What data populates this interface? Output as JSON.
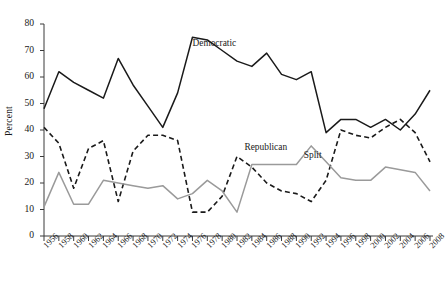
{
  "chart_data": {
    "type": "line",
    "title": "",
    "xlabel": "",
    "ylabel": "Percent",
    "xlim": [
      1956,
      2008
    ],
    "ylim": [
      0,
      80
    ],
    "grid": false,
    "legend_position": "inline-annotations",
    "x": [
      1956,
      1958,
      1960,
      1962,
      1964,
      1966,
      1968,
      1970,
      1972,
      1974,
      1976,
      1978,
      1980,
      1982,
      1984,
      1986,
      1988,
      1990,
      1992,
      1994,
      1996,
      1998,
      2000,
      2002,
      2004,
      2006,
      2008
    ],
    "xtick_labels": [
      "1956",
      "1958",
      "1960",
      "1962",
      "1964",
      "1966",
      "1968",
      "1970",
      "1972",
      "1974",
      "1976",
      "1978",
      "1980",
      "1982",
      "1984",
      "1986",
      "1988",
      "1990",
      "1992",
      "1994",
      "1996",
      "1998",
      "2000",
      "2002",
      "2004",
      "2006",
      "2008"
    ],
    "ytick_labels": [
      "0",
      "10",
      "20",
      "30",
      "40",
      "50",
      "60",
      "70",
      "80"
    ],
    "ytick_values": [
      0,
      10,
      20,
      30,
      40,
      50,
      60,
      70,
      80
    ],
    "series": [
      {
        "name": "Democratic",
        "style": "solid",
        "color": "#1a1a1a",
        "label_x": 1976,
        "label_y": 72,
        "values": [
          48,
          62,
          58,
          55,
          52,
          67,
          57,
          49,
          41,
          54,
          75,
          74,
          70,
          66,
          64,
          69,
          61,
          59,
          62,
          39,
          44,
          44,
          41,
          44,
          40,
          46,
          55
        ]
      },
      {
        "name": "Republican",
        "style": "dashed",
        "color": "#1a1a1a",
        "label_x": 1983,
        "label_y": 33,
        "values": [
          41,
          35,
          18,
          33,
          36,
          13,
          32,
          38,
          38,
          36,
          9,
          9,
          15,
          30,
          26,
          20,
          17,
          16,
          13,
          21,
          40,
          38,
          37,
          41,
          44,
          39,
          28
        ]
      },
      {
        "name": "Split",
        "style": "solid",
        "color": "#9a9a9a",
        "label_x": 1991,
        "label_y": 30,
        "values": [
          11,
          24,
          12,
          12,
          21,
          20,
          19,
          18,
          19,
          14,
          16,
          21,
          17,
          9,
          27,
          27,
          27,
          27,
          34,
          28,
          22,
          21,
          21,
          26,
          25,
          24,
          17
        ]
      }
    ]
  }
}
